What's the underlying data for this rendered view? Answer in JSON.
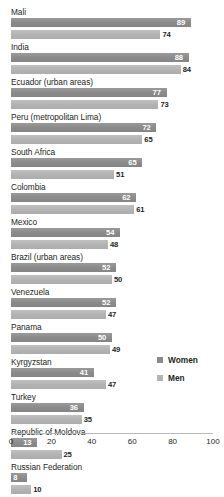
{
  "chart_data": {
    "type": "bar",
    "orientation": "horizontal",
    "title": "",
    "xlabel": "",
    "ylabel": "",
    "xlim": [
      0,
      100
    ],
    "xticks": [
      0,
      20,
      40,
      60,
      80,
      100
    ],
    "grid": false,
    "legend_position": "right",
    "categories": [
      "Mali",
      "India",
      "Ecuador (urban areas)",
      "Peru (metropolitan Lima)",
      "South Africa",
      "Colombia",
      "Mexico",
      "Brazil (urban areas)",
      "Venezuela",
      "Panama",
      "Kyrgyzstan",
      "Turkey",
      "Republic of Moldova",
      "Russian Federation"
    ],
    "series": [
      {
        "name": "Women",
        "color": "#8a8a8a",
        "values": [
          89,
          88,
          77,
          72,
          65,
          62,
          54,
          52,
          52,
          50,
          41,
          36,
          13,
          8
        ]
      },
      {
        "name": "Men",
        "color": "#b4b4b4",
        "values": [
          74,
          84,
          73,
          65,
          51,
          61,
          48,
          50,
          47,
          49,
          47,
          35,
          25,
          10
        ]
      }
    ]
  },
  "legend": {
    "items": [
      {
        "label": "Women",
        "key": "women"
      },
      {
        "label": "Men",
        "key": "men"
      }
    ]
  }
}
